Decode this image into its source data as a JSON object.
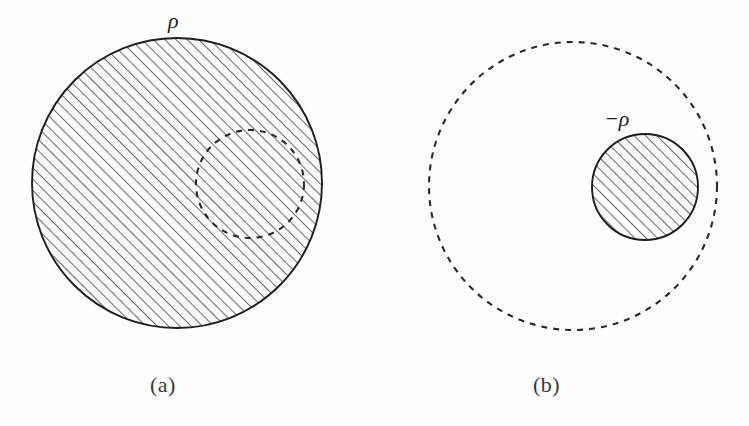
{
  "figure": {
    "background_color": "#fdfdfd",
    "ink_color": "#1e1e1e",
    "caption_color": "#3a3a3a",
    "width": 749,
    "height": 426
  },
  "panels": [
    {
      "id": "a",
      "caption": "(a)",
      "label": "ρ",
      "label_meaning": "positive uniform charge density rho",
      "solid_circle": {
        "cx": 177,
        "cy": 183,
        "r": 145,
        "stroke": "solid",
        "fill": "hatched"
      },
      "dashed_circle": {
        "cx": 250,
        "cy": 184,
        "r": 54,
        "stroke": "dashed",
        "fill": "none"
      }
    },
    {
      "id": "b",
      "caption": "(b)",
      "label": "−ρ",
      "label_meaning": "negative uniform charge density minus rho",
      "dashed_circle": {
        "cx": 573,
        "cy": 186,
        "r": 144,
        "stroke": "dashed",
        "fill": "none"
      },
      "solid_circle": {
        "cx": 645,
        "cy": 187,
        "r": 53,
        "stroke": "solid",
        "fill": "hatched"
      }
    }
  ],
  "hatching": {
    "angle_degrees": 45,
    "spacing_px": 8,
    "line_width_px": 1.4,
    "color": "#2a2a2a"
  },
  "dash_pattern": {
    "dash_px": 6,
    "gap_px": 6,
    "line_width_px": 2.1,
    "color": "#2a2a2a"
  }
}
